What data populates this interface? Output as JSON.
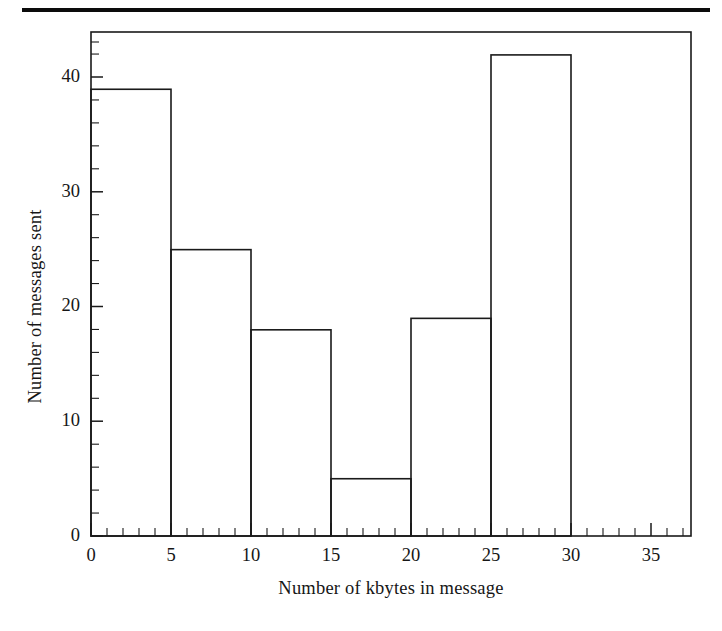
{
  "figure": {
    "top_rule": "horizontal-rule",
    "background_color": "#ffffff",
    "line_color": "#1a1a1a"
  },
  "chart_data": {
    "type": "bar",
    "title": "",
    "subtitle": "",
    "xlabel": "Number of kbytes in message",
    "ylabel": "Number of messages sent",
    "categories": [
      "0-5",
      "5-10",
      "10-15",
      "15-20",
      "20-25",
      "25-30",
      "30-35"
    ],
    "bin_edges": [
      0,
      5,
      10,
      15,
      20,
      25,
      30,
      35
    ],
    "values": [
      39,
      25,
      18,
      5,
      19,
      42,
      0
    ],
    "bin_width": 5,
    "xlim": [
      0,
      37.5
    ],
    "ylim": [
      0,
      44
    ],
    "xticks": [
      0,
      5,
      10,
      15,
      20,
      25,
      30,
      35
    ],
    "xtick_labels": [
      "0",
      "5",
      "10",
      "15",
      "20",
      "25",
      "30",
      "35"
    ],
    "x_minor_tick_step": 1,
    "yticks": [
      0,
      10,
      20,
      30,
      40
    ],
    "ytick_labels": [
      "0",
      "10",
      "20",
      "30",
      "40"
    ],
    "y_minor_tick_step": 2,
    "grid": false,
    "legend": null,
    "legend_position": "none",
    "bar_fill": "none",
    "bar_edge_color": "#1a1a1a",
    "frame": "full-box"
  }
}
